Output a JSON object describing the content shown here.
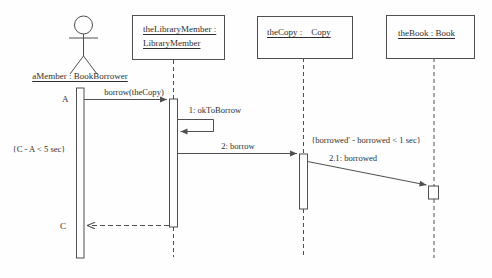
{
  "diagram": {
    "kind": "uml-sequence-diagram",
    "colors": {
      "line": "#4f4f4f",
      "text": "#2e2e2e",
      "background": "#fefefe"
    },
    "actor": {
      "name": "aMember : BookBorrower"
    },
    "objects": [
      {
        "line1": "theLibraryMember :",
        "line2": "LibraryMember"
      },
      {
        "line1": "theCopy :    Copy"
      },
      {
        "line1": "theBook : Book"
      }
    ],
    "messages": [
      {
        "label": "borrow(theCopy)"
      },
      {
        "label": "1: okToBorrow"
      },
      {
        "label": "2: borrow"
      },
      {
        "label": "2.1: borrowed"
      }
    ],
    "constraints": [
      {
        "label": "{C - A < 5 sec}"
      },
      {
        "label": "{borrowed′ - borrowed < 1 sec}"
      }
    ],
    "time_marks": [
      {
        "label": "A"
      },
      {
        "label": "C"
      }
    ]
  }
}
